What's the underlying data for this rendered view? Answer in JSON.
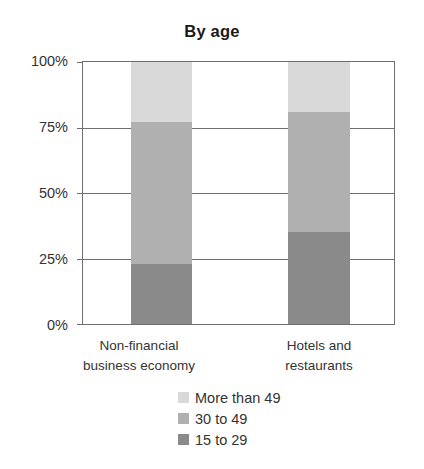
{
  "chart_data": {
    "type": "bar",
    "subtype": "stacked-percentage-column",
    "title": "By age",
    "xlabel": "",
    "ylabel": "",
    "ylim": [
      0,
      100
    ],
    "yunit": "%",
    "grid": true,
    "legend_position": "bottom",
    "categories": [
      "Non-financial business economy",
      "Hotels and restaurants"
    ],
    "category_lines": [
      [
        "Non-financial",
        "business economy"
      ],
      [
        "Hotels and",
        "restaurants"
      ]
    ],
    "ytick_labels": [
      "100%",
      "75%",
      "50%",
      "25%",
      "0%"
    ],
    "ytick_values": [
      100,
      75,
      50,
      25,
      0
    ],
    "series": [
      {
        "name": "More than 49",
        "values": [
          23,
          19
        ],
        "color": "#d9d9d9"
      },
      {
        "name": "30 to 49",
        "values": [
          54,
          46
        ],
        "color": "#b0b0b0"
      },
      {
        "name": "15 to 29",
        "values": [
          23,
          35
        ],
        "color": "#8a8a8a"
      }
    ],
    "stack_order_bottom_to_top": [
      "15 to 29",
      "30 to 49",
      "More than 49"
    ],
    "cumulative_tops": {
      "Non-financial business economy": {
        "15 to 29": 23,
        "30 to 49": 77,
        "More than 49": 100
      },
      "Hotels and restaurants": {
        "15 to 29": 35,
        "30 to 49": 81,
        "More than 49": 100
      }
    },
    "axis_color": "#6f6f6f",
    "background": "#ffffff"
  },
  "legend": {
    "items": [
      {
        "label": "More than 49",
        "color": "#d9d9d9"
      },
      {
        "label": "30 to 49",
        "color": "#b0b0b0"
      },
      {
        "label": "15 to 29",
        "color": "#8a8a8a"
      }
    ]
  }
}
